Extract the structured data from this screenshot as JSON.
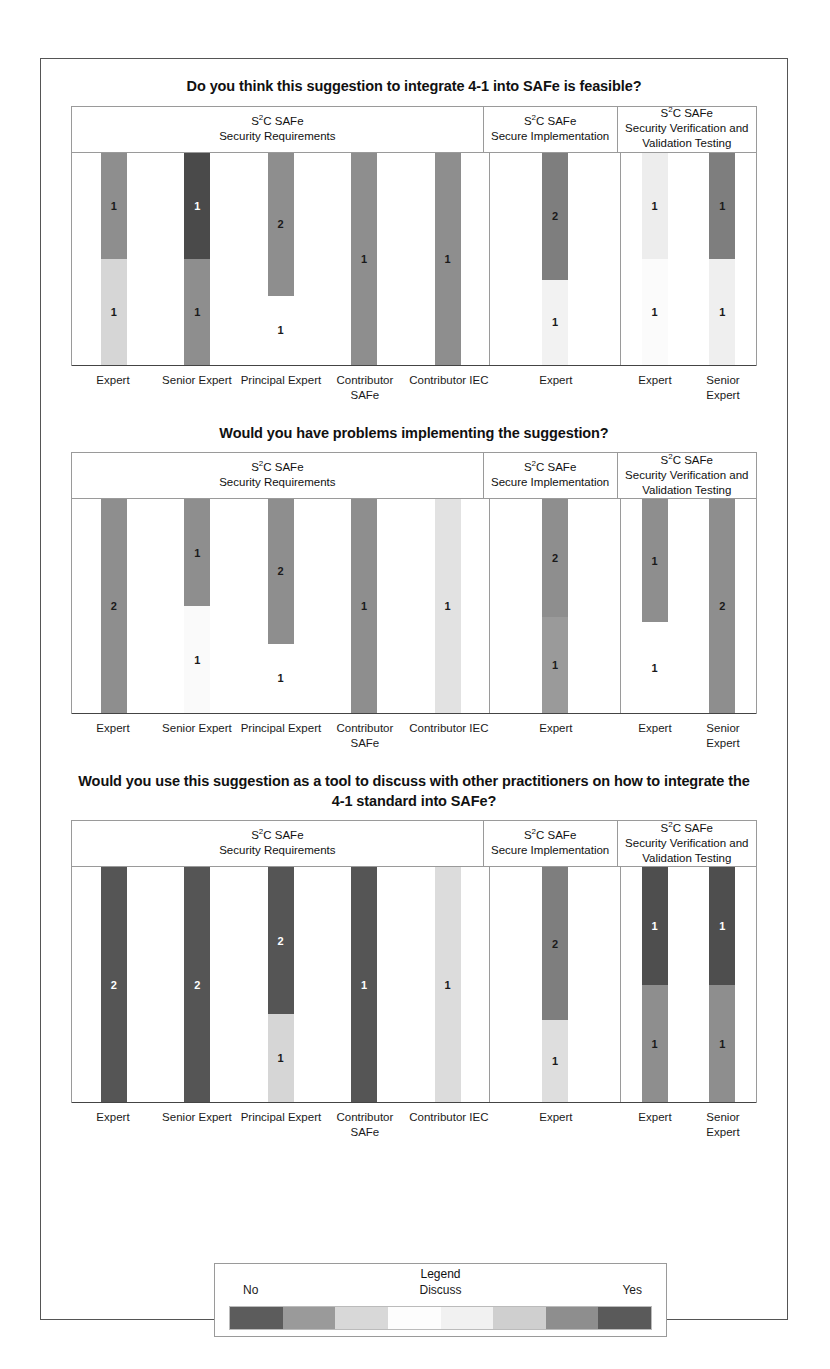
{
  "figure": {
    "legend": {
      "title": "Legend",
      "low_label": "No",
      "mid_label": "Discuss",
      "high_label": "Yes",
      "bands": [
        "#5c5c5c",
        "#9a9a9a",
        "#d8d8d8",
        "#fdfdfd",
        "#f1f1f1",
        "#cfcfcf",
        "#8e8e8e",
        "#5a5a5a"
      ]
    },
    "groups": [
      {
        "title_line1": "S2C SAFe",
        "title_line1_prefix": "S",
        "title_line1_sup": "2",
        "title_line1_suffix": "C SAFe",
        "title_line2": "Security Requirements",
        "categories": [
          "Expert",
          "Senior Expert",
          "Principal Expert",
          "Contributor SAFe",
          "Contributor IEC"
        ]
      },
      {
        "title_line1_prefix": "S",
        "title_line1_sup": "2",
        "title_line1_suffix": "C SAFe",
        "title_line2": "Secure Implementation",
        "categories": [
          "Expert"
        ]
      },
      {
        "title_line1_prefix": "S",
        "title_line1_sup": "2",
        "title_line1_suffix": "C SAFe",
        "title_line2": "Security Verification and Validation Testing",
        "categories": [
          "Expert",
          "Senior Expert"
        ]
      }
    ]
  },
  "chart_data": [
    {
      "type": "bar",
      "title": "Do you think this suggestion to integrate 4-1 into SAFe is feasible?",
      "stacked": true,
      "ylim": [
        0,
        2
      ],
      "grid": false,
      "legend_position": "bottom",
      "xlabel": "",
      "ylabel": "",
      "groups": [
        {
          "name": "S2C SAFe Security Requirements",
          "categories": [
            "Expert",
            "Senior Expert",
            "Principal Expert",
            "Contributor SAFe",
            "Contributor IEC"
          ],
          "bars": [
            {
              "category": "Expert",
              "segments": [
                {
                  "label": "1",
                  "value": 1,
                  "color": "#8e8e8e",
                  "text_color": "#1a1a1a"
                },
                {
                  "label": "1",
                  "value": 1,
                  "color": "#d6d6d6",
                  "text_color": "#1a1a1a"
                }
              ]
            },
            {
              "category": "Senior Expert",
              "segments": [
                {
                  "label": "1",
                  "value": 1,
                  "color": "#4a4a4a",
                  "text_color": "#ffffff"
                },
                {
                  "label": "1",
                  "value": 1,
                  "color": "#8e8e8e",
                  "text_color": "#1a1a1a"
                }
              ]
            },
            {
              "category": "Principal Expert",
              "segments": [
                {
                  "label": "2",
                  "value": 1.35,
                  "color": "#8e8e8e",
                  "text_color": "#1a1a1a"
                },
                {
                  "label": "1",
                  "value": 0.65,
                  "color": "#ffffff",
                  "text_color": "#1a1a1a"
                }
              ]
            },
            {
              "category": "Contributor SAFe",
              "segments": [
                {
                  "label": "1",
                  "value": 2,
                  "color": "#8e8e8e",
                  "text_color": "#1a1a1a"
                }
              ]
            },
            {
              "category": "Contributor IEC",
              "segments": [
                {
                  "label": "1",
                  "value": 2,
                  "color": "#8e8e8e",
                  "text_color": "#1a1a1a"
                }
              ]
            }
          ]
        },
        {
          "name": "S2C SAFe Secure Implementation",
          "categories": [
            "Expert"
          ],
          "bars": [
            {
              "category": "Expert",
              "segments": [
                {
                  "label": "2",
                  "value": 1.2,
                  "color": "#7e7e7e",
                  "text_color": "#1a1a1a"
                },
                {
                  "label": "1",
                  "value": 0.8,
                  "color": "#f2f2f2",
                  "text_color": "#1a1a1a"
                }
              ]
            }
          ]
        },
        {
          "name": "S2C SAFe Security Verification and Validation Testing",
          "categories": [
            "Expert",
            "Senior Expert"
          ],
          "bars": [
            {
              "category": "Expert",
              "segments": [
                {
                  "label": "1",
                  "value": 1,
                  "color": "#ededed",
                  "text_color": "#1a1a1a"
                },
                {
                  "label": "1",
                  "value": 1,
                  "color": "#fbfbfb",
                  "text_color": "#1a1a1a"
                }
              ]
            },
            {
              "category": "Senior Expert",
              "segments": [
                {
                  "label": "1",
                  "value": 1,
                  "color": "#7e7e7e",
                  "text_color": "#1a1a1a"
                },
                {
                  "label": "1",
                  "value": 1,
                  "color": "#efefef",
                  "text_color": "#1a1a1a"
                }
              ]
            }
          ]
        }
      ]
    },
    {
      "type": "bar",
      "title": "Would you have problems implementing the suggestion?",
      "stacked": true,
      "ylim": [
        0,
        2
      ],
      "grid": false,
      "legend_position": "bottom",
      "xlabel": "",
      "ylabel": "",
      "groups": [
        {
          "name": "S2C SAFe Security Requirements",
          "categories": [
            "Expert",
            "Senior Expert",
            "Principal Expert",
            "Contributor SAFe",
            "Contributor IEC"
          ],
          "bars": [
            {
              "category": "Expert",
              "segments": [
                {
                  "label": "2",
                  "value": 2,
                  "color": "#8e8e8e",
                  "text_color": "#1a1a1a"
                }
              ]
            },
            {
              "category": "Senior Expert",
              "segments": [
                {
                  "label": "1",
                  "value": 1,
                  "color": "#8e8e8e",
                  "text_color": "#1a1a1a"
                },
                {
                  "label": "1",
                  "value": 1,
                  "color": "#fafafa",
                  "text_color": "#1a1a1a"
                }
              ]
            },
            {
              "category": "Principal Expert",
              "segments": [
                {
                  "label": "2",
                  "value": 1.35,
                  "color": "#8e8e8e",
                  "text_color": "#1a1a1a"
                },
                {
                  "label": "1",
                  "value": 0.65,
                  "color": "#ffffff",
                  "text_color": "#1a1a1a"
                }
              ]
            },
            {
              "category": "Contributor SAFe",
              "segments": [
                {
                  "label": "1",
                  "value": 2,
                  "color": "#8e8e8e",
                  "text_color": "#1a1a1a"
                }
              ]
            },
            {
              "category": "Contributor IEC",
              "segments": [
                {
                  "label": "1",
                  "value": 2,
                  "color": "#e2e2e2",
                  "text_color": "#1a1a1a"
                }
              ]
            }
          ]
        },
        {
          "name": "S2C SAFe Secure Implementation",
          "categories": [
            "Expert"
          ],
          "bars": [
            {
              "category": "Expert",
              "segments": [
                {
                  "label": "2",
                  "value": 1.1,
                  "color": "#8e8e8e",
                  "text_color": "#1a1a1a"
                },
                {
                  "label": "1",
                  "value": 0.9,
                  "color": "#9a9a9a",
                  "text_color": "#1a1a1a"
                }
              ]
            }
          ]
        },
        {
          "name": "S2C SAFe Security Verification and Validation Testing",
          "categories": [
            "Expert",
            "Senior Expert"
          ],
          "bars": [
            {
              "category": "Expert",
              "segments": [
                {
                  "label": "1",
                  "value": 1.15,
                  "color": "#8e8e8e",
                  "text_color": "#1a1a1a"
                },
                {
                  "label": "1",
                  "value": 0.85,
                  "color": "#ffffff",
                  "text_color": "#1a1a1a"
                }
              ]
            },
            {
              "category": "Senior Expert",
              "segments": [
                {
                  "label": "2",
                  "value": 2,
                  "color": "#8e8e8e",
                  "text_color": "#1a1a1a"
                }
              ]
            }
          ]
        }
      ]
    },
    {
      "type": "bar",
      "title": "Would you use this suggestion as a tool to discuss with other practitioners on how to integrate the 4-1 standard into SAFe?",
      "stacked": true,
      "ylim": [
        0,
        2
      ],
      "grid": false,
      "legend_position": "bottom",
      "xlabel": "",
      "ylabel": "",
      "groups": [
        {
          "name": "S2C SAFe Security Requirements",
          "categories": [
            "Expert",
            "Senior Expert",
            "Principal Expert",
            "Contributor SAFe",
            "Contributor IEC"
          ],
          "bars": [
            {
              "category": "Expert",
              "segments": [
                {
                  "label": "2",
                  "value": 2,
                  "color": "#555555",
                  "text_color": "#ffffff"
                }
              ]
            },
            {
              "category": "Senior Expert",
              "segments": [
                {
                  "label": "2",
                  "value": 2,
                  "color": "#555555",
                  "text_color": "#ffffff"
                }
              ]
            },
            {
              "category": "Principal Expert",
              "segments": [
                {
                  "label": "2",
                  "value": 1.25,
                  "color": "#555555",
                  "text_color": "#ffffff"
                },
                {
                  "label": "1",
                  "value": 0.75,
                  "color": "#d6d6d6",
                  "text_color": "#1a1a1a"
                }
              ]
            },
            {
              "category": "Contributor SAFe",
              "segments": [
                {
                  "label": "1",
                  "value": 2,
                  "color": "#555555",
                  "text_color": "#ffffff"
                }
              ]
            },
            {
              "category": "Contributor IEC",
              "segments": [
                {
                  "label": "1",
                  "value": 2,
                  "color": "#dcdcdc",
                  "text_color": "#1a1a1a"
                }
              ]
            }
          ]
        },
        {
          "name": "S2C SAFe Secure Implementation",
          "categories": [
            "Expert"
          ],
          "bars": [
            {
              "category": "Expert",
              "segments": [
                {
                  "label": "2",
                  "value": 1.3,
                  "color": "#7e7e7e",
                  "text_color": "#1a1a1a"
                },
                {
                  "label": "1",
                  "value": 0.7,
                  "color": "#dedede",
                  "text_color": "#1a1a1a"
                }
              ]
            }
          ]
        },
        {
          "name": "S2C SAFe Security Verification and Validation Testing",
          "categories": [
            "Expert",
            "Senior Expert"
          ],
          "bars": [
            {
              "category": "Expert",
              "segments": [
                {
                  "label": "1",
                  "value": 1,
                  "color": "#4e4e4e",
                  "text_color": "#ffffff"
                },
                {
                  "label": "1",
                  "value": 1,
                  "color": "#8e8e8e",
                  "text_color": "#1a1a1a"
                }
              ]
            },
            {
              "category": "Senior Expert",
              "segments": [
                {
                  "label": "1",
                  "value": 1,
                  "color": "#4e4e4e",
                  "text_color": "#ffffff"
                },
                {
                  "label": "1",
                  "value": 1,
                  "color": "#8e8e8e",
                  "text_color": "#1a1a1a"
                }
              ]
            }
          ]
        }
      ]
    }
  ]
}
